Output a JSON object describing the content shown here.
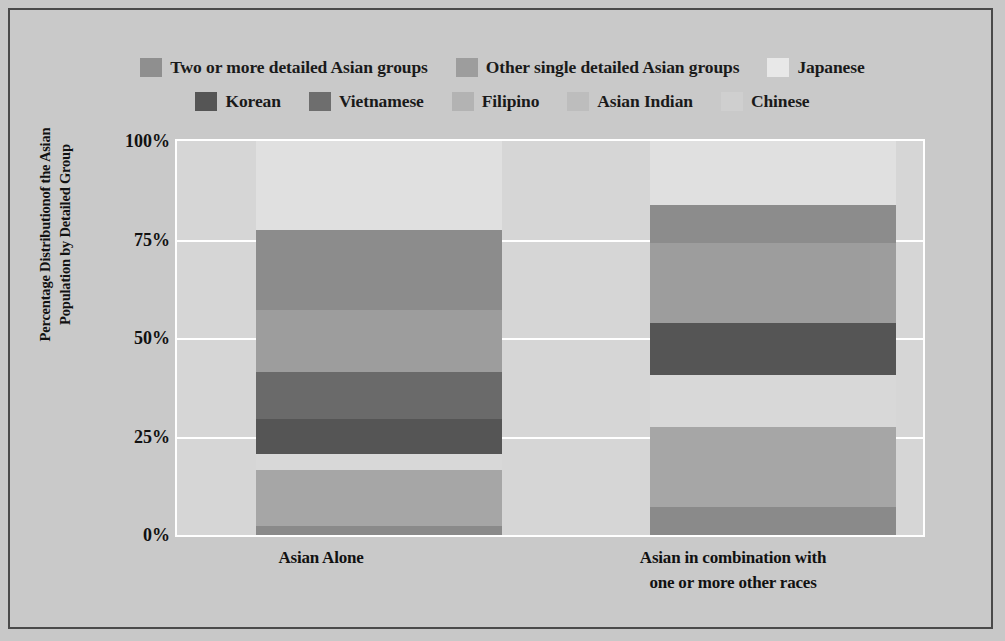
{
  "chart_data": {
    "type": "bar",
    "subtype": "stacked-percentage",
    "title": "",
    "xlabel": "",
    "ylabel": "Percentage Distributionof the Asian Population by Detailed Group",
    "ylim": [
      0,
      100
    ],
    "yticks": [
      "0%",
      "25%",
      "50%",
      "75%",
      "100%"
    ],
    "ytick_values": [
      0,
      25,
      50,
      75,
      100
    ],
    "grid": true,
    "legend_position": "top",
    "categories": [
      "Asian Alone",
      "Asian in combination with one or more other races"
    ],
    "series": [
      {
        "name": "Chinese",
        "color": "#8a8a8a",
        "values": [
          2.3,
          7.2
        ]
      },
      {
        "name": "Asian Indian",
        "color": "#a6a6a6",
        "values": [
          14.1,
          20.3
        ]
      },
      {
        "name": "Filipino",
        "color": "#d8d8d8",
        "values": [
          4.1,
          13.1
        ]
      },
      {
        "name": "Korean",
        "color": "#555555",
        "values": [
          9.0,
          13.1
        ]
      },
      {
        "name": "Vietnamese",
        "color": "#6e6e6e",
        "values": [
          12.0,
          0.0
        ]
      },
      {
        "name": "Other single detailed Asian groups",
        "color": "#9d9d9d",
        "values": [
          15.6,
          20.3
        ]
      },
      {
        "name": "Two or more detailed Asian groups",
        "color": "#8f8f8f",
        "values": [
          20.3,
          9.7
        ]
      },
      {
        "name": "Japanese",
        "color": "#e2e2e2",
        "values": [
          22.6,
          16.3
        ]
      }
    ]
  },
  "legend": {
    "row1": [
      {
        "label": "Two or more detailed Asian groups",
        "color": "#8f8f8f"
      },
      {
        "label": "Other single detailed Asian groups",
        "color": "#9d9d9d"
      },
      {
        "label": "Japanese",
        "color": "#e8e8e8"
      }
    ],
    "row2": [
      {
        "label": "Korean",
        "color": "#555555"
      },
      {
        "label": "Vietnamese",
        "color": "#6e6e6e"
      },
      {
        "label": "Filipino",
        "color": "#b3b3b3"
      },
      {
        "label": "Asian Indian",
        "color": "#bdbdbd"
      },
      {
        "label": "Chinese",
        "color": "#cfcfcf"
      }
    ]
  },
  "axis": {
    "y_title": "Percentage Distributionof the Asian\nPopulation by Detailed Group",
    "y_title_line1": "Percentage Distributionof the Asian",
    "y_title_line2": "Population by Detailed Group",
    "ticks": [
      {
        "label": "100%",
        "value": 100
      },
      {
        "label": "75%",
        "value": 75
      },
      {
        "label": "50%",
        "value": 50
      },
      {
        "label": "25%",
        "value": 25
      },
      {
        "label": "0%",
        "value": 0
      }
    ]
  },
  "xcategories": [
    {
      "line1": "Asian Alone",
      "line2": ""
    },
    {
      "line1": "Asian in combination with",
      "line2": "one or more other races"
    }
  ],
  "bars": [
    {
      "name": "Asian Alone",
      "segments": [
        {
          "series": "Chinese",
          "value": 2.3,
          "color": "#8a8a8a"
        },
        {
          "series": "Asian Indian",
          "value": 14.1,
          "color": "#a6a6a6"
        },
        {
          "series": "Filipino",
          "value": 4.1,
          "color": "#d8d8d8"
        },
        {
          "series": "Korean",
          "value": 9.0,
          "color": "#555555"
        },
        {
          "series": "Vietnamese",
          "value": 12.0,
          "color": "#6a6a6a"
        },
        {
          "series": "Other single detailed Asian groups",
          "value": 15.6,
          "color": "#9d9d9d"
        },
        {
          "series": "Two or more detailed Asian groups",
          "value": 20.3,
          "color": "#8c8c8c"
        },
        {
          "series": "Japanese",
          "value": 22.6,
          "color": "#e0e0e0"
        }
      ]
    },
    {
      "name": "Asian in combination with one or more other races",
      "segments": [
        {
          "series": "Chinese",
          "value": 7.2,
          "color": "#8a8a8a"
        },
        {
          "series": "Asian Indian",
          "value": 20.3,
          "color": "#a6a6a6"
        },
        {
          "series": "Filipino",
          "value": 13.1,
          "color": "#d8d8d8"
        },
        {
          "series": "Korean",
          "value": 13.1,
          "color": "#555555"
        },
        {
          "series": "Other single detailed Asian groups",
          "value": 20.3,
          "color": "#9d9d9d"
        },
        {
          "series": "Two or more detailed Asian groups",
          "value": 9.7,
          "color": "#8c8c8c"
        },
        {
          "series": "Japanese",
          "value": 16.3,
          "color": "#e0e0e0"
        }
      ]
    }
  ]
}
